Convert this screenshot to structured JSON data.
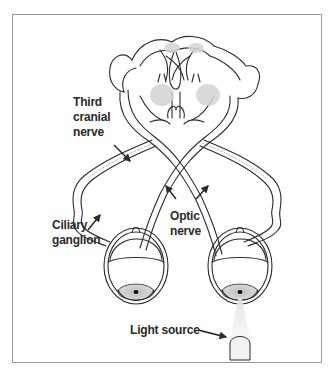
{
  "diagram": {
    "labels": {
      "third_cranial_nerve": [
        "Third",
        "cranial",
        "nerve"
      ],
      "ciliary_ganglion": [
        "Ciliary",
        "ganglion"
      ],
      "optic_nerve": [
        "Optic",
        "nerve"
      ],
      "light_source": "Light source"
    },
    "colors": {
      "line": "#2b2b2b",
      "shade": "#d8d8d8",
      "frame": "#9a9a9a",
      "background": "#ffffff"
    }
  }
}
